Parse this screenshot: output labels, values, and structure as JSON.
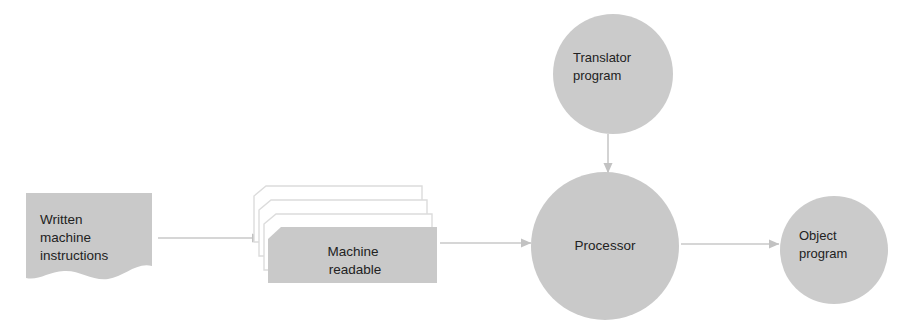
{
  "diagram": {
    "colors": {
      "shape_fill": "#c9c9c9",
      "shape_fill_light": "#cfcfcf",
      "card_outline": "#d8d8d8",
      "card_face": "#ffffff",
      "arrow": "#c8c8c8",
      "text": "#222222",
      "background": "#ffffff"
    },
    "nodes": [
      {
        "id": "written-machine-instructions",
        "shape": "document",
        "lines": [
          "Written",
          "machine",
          "instructions"
        ],
        "text_anchor": "start"
      },
      {
        "id": "machine-readable",
        "shape": "card-stack",
        "stack_count": 4,
        "lines": [
          "Machine",
          "readable"
        ],
        "text_anchor": "middle"
      },
      {
        "id": "translator-program",
        "shape": "circle",
        "lines": [
          "Translator",
          "program"
        ],
        "text_anchor": "start"
      },
      {
        "id": "processor",
        "shape": "circle",
        "lines": [
          "Processor"
        ],
        "text_anchor": "middle"
      },
      {
        "id": "object-program",
        "shape": "circle",
        "lines": [
          "Object",
          "program"
        ],
        "text_anchor": "start"
      }
    ],
    "connectors": [
      {
        "id": "instructions-to-cards",
        "from": "written-machine-instructions",
        "to": "machine-readable",
        "direction": "right"
      },
      {
        "id": "cards-to-processor",
        "from": "machine-readable",
        "to": "processor",
        "direction": "right"
      },
      {
        "id": "translator-to-processor",
        "from": "translator-program",
        "to": "processor",
        "direction": "down"
      },
      {
        "id": "processor-to-object",
        "from": "processor",
        "to": "object-program",
        "direction": "right"
      }
    ]
  }
}
